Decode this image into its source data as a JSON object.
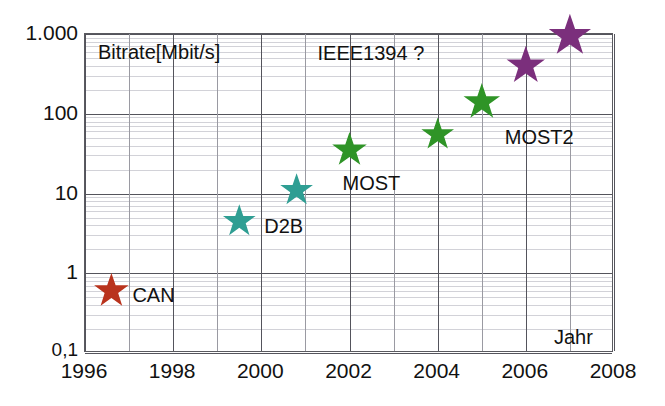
{
  "chart_data": {
    "type": "scatter",
    "title": "",
    "xlabel": "Jahr",
    "ylabel": "Bitrate[Mbit/s]",
    "yscale": "log",
    "xlim": [
      1996,
      2008
    ],
    "ylim": [
      0.1,
      1000
    ],
    "grid": true,
    "legend": "none",
    "x_ticks": [
      "1996",
      "1998",
      "2000",
      "2002",
      "2004",
      "2006",
      "2008"
    ],
    "x_tick_values": [
      1996,
      1998,
      2000,
      2002,
      2004,
      2006,
      2008
    ],
    "y_ticks": [
      "0,1",
      "1",
      "10",
      "100",
      "1.000"
    ],
    "y_tick_values": [
      0.1,
      1,
      10,
      100,
      1000
    ],
    "points": [
      {
        "label": "CAN",
        "x": 1996.6,
        "y": 0.6,
        "color": "#b9331d",
        "size": 36,
        "label_dx": 22,
        "label_dy": 5
      },
      {
        "label": "D2B",
        "x": 1999.5,
        "y": 4.5,
        "color": "#2f9e93",
        "size": 34,
        "label_dx": 26,
        "label_dy": 6
      },
      {
        "label": "",
        "x": 2000.8,
        "y": 11,
        "color": "#2f9e93",
        "size": 34,
        "label_dx": 0,
        "label_dy": 0
      },
      {
        "label": "MOST",
        "x": 2002.0,
        "y": 35,
        "color": "#2f9427",
        "size": 36,
        "label_dx": -6,
        "label_dy": 34
      },
      {
        "label": "",
        "x": 2004.0,
        "y": 55,
        "color": "#2f9427",
        "size": 34,
        "label_dx": 0,
        "label_dy": 0
      },
      {
        "label": "MOST2",
        "x": 2005.0,
        "y": 140,
        "color": "#2f9427",
        "size": 38,
        "label_dx": 24,
        "label_dy": 36
      },
      {
        "label": "",
        "x": 2006.0,
        "y": 400,
        "color": "#7b2f7c",
        "size": 40,
        "label_dx": 0,
        "label_dy": 0
      },
      {
        "label": "",
        "x": 2007.0,
        "y": 950,
        "color": "#7b2f7c",
        "size": 44,
        "label_dx": 0,
        "label_dy": 0
      }
    ],
    "annotations": [
      {
        "name": "ieee1394-annotation",
        "text": "IEEE1394 ?",
        "x": 2004.2,
        "y": 560
      }
    ],
    "colors": {
      "can": "#b9331d",
      "d2b": "#2f9e93",
      "most": "#2f9427",
      "ieee1394": "#7b2f7c",
      "grid_major": "#54545c",
      "grid_minor": "#d2d2d8",
      "axis": "#5a5a60",
      "background": "#ffffff"
    }
  }
}
